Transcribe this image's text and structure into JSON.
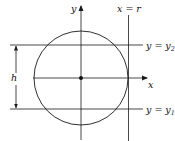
{
  "diagram": {
    "colors": {
      "stroke": "#1a1a1a",
      "background": "#ffffff"
    },
    "axes": {
      "x_label": "x",
      "y_label": "y"
    },
    "lines": {
      "vertical_label": "x = r",
      "upper": {
        "lhs": "y = y",
        "sub": "2"
      },
      "lower": {
        "lhs": "y = y",
        "sub": "1"
      }
    },
    "dimension_label": "h",
    "center_point": "origin"
  }
}
